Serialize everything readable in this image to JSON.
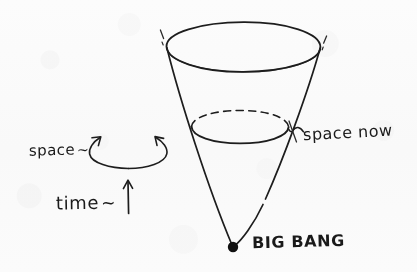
{
  "figure": {
    "kind": "hand-drawn-sketch",
    "background_color": "#fdfdfd",
    "ink_color": "#1a1a1a"
  },
  "labels": {
    "space": "space",
    "space_squiggle": "~",
    "time": "time",
    "time_squiggle": "~",
    "space_now": "space now",
    "big_bang": "BIG BANG"
  },
  "diagram_data": {
    "type": "diagram",
    "title": "Expanding universe light cone",
    "elements": [
      {
        "name": "cone-top-ellipse",
        "role": "present-or-future-space-slice",
        "center": [
          243,
          47
        ],
        "rx": 77,
        "ry": 25,
        "stroke": "solid"
      },
      {
        "name": "cone-inner-ellipse",
        "role": "space-now-slice",
        "center": [
          240,
          127
        ],
        "rx": 49,
        "ry": 16,
        "front_arc": "solid",
        "back_arc": "dashed"
      },
      {
        "name": "cone-left-edge",
        "from": [
          167,
          45
        ],
        "to": [
          233,
          247
        ]
      },
      {
        "name": "cone-right-edge",
        "from": [
          320,
          47
        ],
        "to": [
          233,
          247
        ]
      },
      {
        "name": "big-bang-point",
        "role": "singularity",
        "center": [
          233,
          247
        ],
        "radius": 5,
        "fill": "#111111"
      },
      {
        "name": "space-rotation-arrow",
        "role": "space-axis-indicator",
        "center": [
          128,
          148
        ],
        "rx": 40,
        "ry": 15,
        "arrowheads": 2
      },
      {
        "name": "time-arrow",
        "role": "time-axis-indicator",
        "from": [
          128,
          213
        ],
        "to": [
          128,
          180
        ],
        "direction": "up"
      },
      {
        "name": "space-now-leader",
        "from": [
          304,
          130
        ],
        "to": [
          288,
          128
        ]
      }
    ]
  }
}
